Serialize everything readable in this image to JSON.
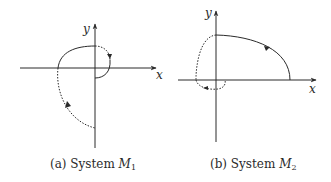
{
  "figure": {
    "panels": [
      {
        "id": "a",
        "axes": {
          "x_label": "x",
          "y_label": "y"
        },
        "caption": {
          "prefix": "(a) System ",
          "symbol": "M",
          "subscript": "1"
        },
        "trajectory": {
          "solid_segments": [
            "upper-left arc from negative x-axis to positive y-axis",
            "inner arc from positive x-axis curving back to negative y-axis near origin"
          ],
          "dotted_segments": [
            "arc from positive y-axis to positive x-axis with arrow",
            "lower-left arc from negative y-axis up to negative x-axis with arrow"
          ]
        }
      },
      {
        "id": "b",
        "axes": {
          "x_label": "x",
          "y_label": "y"
        },
        "caption": {
          "prefix": "(b) System ",
          "symbol": "M",
          "subscript": "2"
        },
        "trajectory": {
          "solid_segments": [
            "large arc from positive y-axis to positive x-axis with arrow"
          ],
          "dotted_segments": [
            "left arc from positive y-axis down to negative x-axis",
            "small loop below origin with arrow"
          ]
        }
      }
    ],
    "colors": {
      "line": "#2a2a2a",
      "background": "#ffffff"
    }
  }
}
